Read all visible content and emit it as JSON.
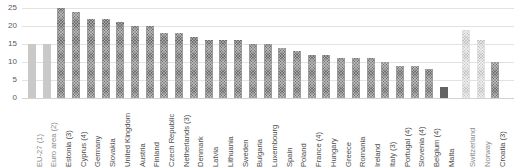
{
  "chart_data": {
    "type": "bar",
    "title": "",
    "subtitle": "",
    "xlabel": "",
    "ylabel": "",
    "ylim": [
      0,
      25
    ],
    "yticks": [
      0,
      5,
      10,
      15,
      20,
      25
    ],
    "grid": true,
    "legend": "none",
    "categories": [
      "EU-27 (1)",
      "Euro area (2)",
      "Estonia (3)",
      "Cyprus (4)",
      "Germany",
      "Slovakia",
      "United Kingdom",
      "Austria",
      "Finland",
      "Czech Republic",
      "Netherlands (3)",
      "Denmark",
      "Latvia",
      "Lithuania",
      "Sweden",
      "Bulgaria",
      "Luxembourg",
      "Spain",
      "Poland",
      "France (4)",
      "Hungary",
      "Greece",
      "Romania",
      "Ireland",
      "Italy (3)",
      "Portugal (4)",
      "Slovenia (4)",
      "Belgium (4)",
      "Malta",
      "Switzerland",
      "Norway",
      "Croatia (3)"
    ],
    "values": [
      15,
      15,
      25,
      24,
      22,
      22,
      21,
      20,
      20,
      18,
      18,
      17,
      16,
      16,
      16,
      15,
      15,
      14,
      13,
      12,
      12,
      11,
      11,
      11,
      10,
      9,
      9,
      8,
      3,
      19,
      16,
      10
    ],
    "styles": [
      "solid-light",
      "solid-light",
      "hatch-dark",
      "hatch-dark",
      "hatch-dark",
      "hatch-dark",
      "hatch-dark",
      "hatch-dark",
      "hatch-dark",
      "hatch-dark",
      "hatch-dark",
      "hatch-dark",
      "hatch-dark",
      "hatch-dark",
      "hatch-dark",
      "hatch-dark",
      "hatch-dark",
      "hatch-dark",
      "hatch-dark",
      "hatch-dark",
      "hatch-dark",
      "hatch-dark",
      "hatch-dark",
      "hatch-dark",
      "hatch-dark",
      "hatch-dark",
      "hatch-dark",
      "hatch-dark",
      "solid-dark",
      "hatch-light",
      "hatch-light",
      "hatch-dark"
    ],
    "colors": {
      "bar_dark": "#636363",
      "bar_light": "#c9c9c9",
      "gridline": "#e2e2e2",
      "baseline": "#d2d2d2",
      "tick_label": "#595959",
      "category_label": "#4d4d4d",
      "background": "#ffffff"
    }
  }
}
